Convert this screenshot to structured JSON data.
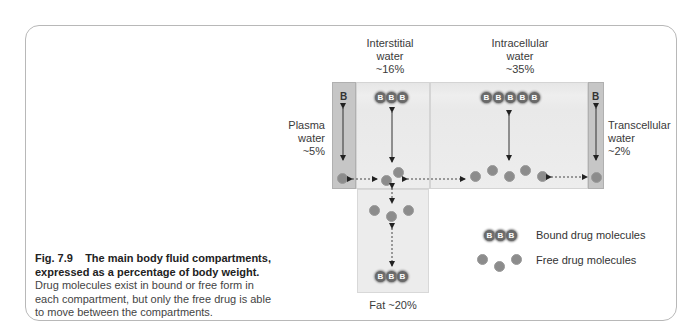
{
  "compartments": {
    "plasma": {
      "name": "Plasma",
      "line2": "water",
      "pct": "~5%"
    },
    "interstitial": {
      "name": "Interstitial",
      "line2": "water",
      "pct": "~16%"
    },
    "intracellular": {
      "name": "Intracellular",
      "line2": "water",
      "pct": "~35%"
    },
    "transcellular": {
      "name": "Transcellular",
      "line2": "water",
      "pct": "~2%"
    },
    "fat": {
      "label": "Fat ~20%"
    }
  },
  "bound_symbol": "B",
  "legend": {
    "bound": "Bound drug molecules",
    "free": "Free drug molecules"
  },
  "caption": {
    "fig_number": "Fig. 7.9",
    "title_line1": "The main body fluid compartments,",
    "title_line2": "expressed as a percentage of body weight.",
    "body": "Drug molecules exist in bound or free form in each compartment, but only the free drug is able to move between the compartments."
  },
  "colors": {
    "compartment_light": "#eaeaea",
    "compartment_dark": "#c6c6c6",
    "molecule": "#8c8c8c",
    "bound_molecule": "#6a6a6a",
    "frame": "#b8b8b8"
  }
}
